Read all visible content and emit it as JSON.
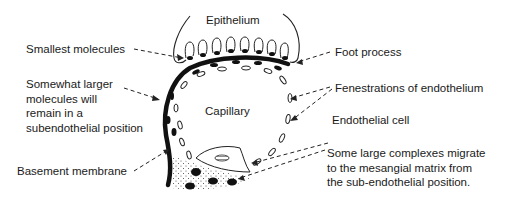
{
  "diagram": {
    "structures": {
      "epithelium": "Epithelium",
      "capillary": "Capillary"
    },
    "labels": {
      "smallest_molecules": "Smallest molecules",
      "somewhat_larger": "Somewhat larger\nmolecules will\nremain in a\nsubendothelial position",
      "basement_membrane": "Basement membrane",
      "foot_process": "Foot process",
      "fenestrations": "Fenestrations of endothelium",
      "endothelial_cell": "Endothelial cell",
      "large_complexes": "Some large complexes migrate\nto the mesangial matrix from\nthe sub-endothelial position."
    }
  }
}
